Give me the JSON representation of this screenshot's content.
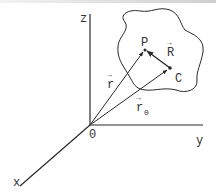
{
  "diagram": {
    "type": "vector-diagram",
    "axes": {
      "z_label": "z",
      "y_label": "y",
      "x_label": "x",
      "origin_label": "0"
    },
    "points": {
      "p_label": "P",
      "c_label": "C"
    },
    "vectors": {
      "r_label": "r",
      "r0_label": "r",
      "r0_subscript": "0",
      "R_label": "R",
      "arrow_mark": "→"
    },
    "colors": {
      "line": "#2a2a2a",
      "text": "#333333",
      "background": "#ffffff"
    }
  }
}
